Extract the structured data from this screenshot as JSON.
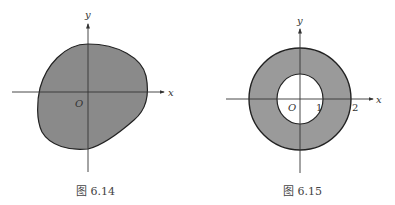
{
  "figures": [
    {
      "caption": "图 6.14",
      "x_label": "x",
      "y_label": "y",
      "origin_label": "O",
      "fill_color": "#8a8a8a"
    },
    {
      "caption": "图 6.15",
      "x_label": "x",
      "y_label": "y",
      "origin_label": "O",
      "tick_labels": [
        "1",
        "2"
      ],
      "fill_color": "#999999",
      "inner_radius": 1,
      "outer_radius": 2
    }
  ]
}
